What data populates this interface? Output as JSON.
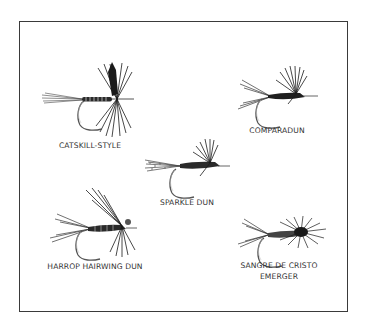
{
  "figure": {
    "type": "illustration-plate",
    "colors": {
      "ink": "#1a1a1a",
      "border": "#3a3a3a",
      "background": "#ffffff",
      "label": "#333333"
    },
    "flies": [
      {
        "id": "catskill",
        "label": "CATSKILL-STYLE"
      },
      {
        "id": "comparadun",
        "label": "COMPARADUN"
      },
      {
        "id": "sparkle",
        "label": "SPARKLE DUN"
      },
      {
        "id": "harrop",
        "label": "HARROP HAIRWING DUN"
      },
      {
        "id": "sangre",
        "label_line1": "SANGRE DE CRISTO",
        "label_line2": "EMERGER"
      }
    ]
  }
}
